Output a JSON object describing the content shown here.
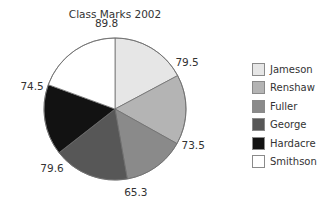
{
  "chart_data": {
    "type": "pie",
    "title": "Class Marks 2002",
    "categories": [
      "Jameson",
      "Renshaw",
      "Fuller",
      "George",
      "Hardacre",
      "Smithson"
    ],
    "values": [
      79.5,
      73.5,
      65.3,
      79.6,
      74.5,
      89.8
    ],
    "colors": [
      "#e6e6e6",
      "#b4b4b4",
      "#8a8a8a",
      "#575757",
      "#121212",
      "#ffffff"
    ],
    "start_angle": "12 o'clock",
    "direction": "clockwise",
    "legend_position": "right"
  },
  "legend": {
    "items": [
      {
        "label": "Jameson",
        "color": "#e6e6e6"
      },
      {
        "label": "Renshaw",
        "color": "#b4b4b4"
      },
      {
        "label": "Fuller",
        "color": "#8a8a8a"
      },
      {
        "label": "George",
        "color": "#575757"
      },
      {
        "label": "Hardacre",
        "color": "#121212"
      },
      {
        "label": "Smithson",
        "color": "#ffffff"
      }
    ]
  }
}
